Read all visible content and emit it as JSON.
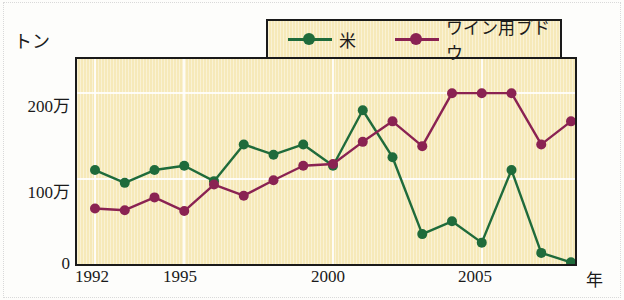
{
  "chart_data": {
    "type": "line",
    "title": "",
    "xlabel": "年",
    "ylabel": "トン",
    "grid": true,
    "legend_position": "top-center",
    "x": [
      1992,
      1993,
      1994,
      1995,
      1996,
      1997,
      1998,
      1999,
      2000,
      2001,
      2002,
      2003,
      2004,
      2005,
      2006,
      2007,
      2008
    ],
    "xlim": [
      1992,
      2008
    ],
    "ylim": [
      0,
      240
    ],
    "y_unit": "万トン",
    "y_ticks": [
      0,
      100,
      200
    ],
    "y_tick_labels": [
      "0",
      "100万",
      "200万"
    ],
    "x_tick_years": [
      1992,
      1995,
      2000,
      2005
    ],
    "x_tick_labels": [
      "1992",
      "1995",
      "2000",
      "2005"
    ],
    "series": [
      {
        "name": "米",
        "color": "#1f6b3b",
        "marker": "circle",
        "values": [
          110,
          95,
          110,
          115,
          97,
          140,
          128,
          140,
          115,
          180,
          125,
          35,
          50,
          25,
          110,
          13,
          2
        ]
      },
      {
        "name": "ワイン用ブドウ",
        "color": "#8a2252",
        "marker": "circle",
        "values": [
          65,
          63,
          78,
          62,
          93,
          80,
          98,
          115,
          117,
          143,
          167,
          138,
          200,
          200,
          200,
          140,
          167
        ]
      }
    ]
  },
  "axes": {
    "y_title": "トン",
    "x_title": "年",
    "y_tick_labels": [
      "200万",
      "100万",
      "0"
    ],
    "x_tick_labels": [
      "1992",
      "1995",
      "2000",
      "2005"
    ]
  },
  "legend": {
    "entries": [
      {
        "label": "米",
        "color": "#1f6b3b"
      },
      {
        "label": "ワイン用ブドウ",
        "color": "#8a2252"
      }
    ]
  },
  "colors": {
    "plot_background": "#f6e9b9",
    "frame": "#1a1a1a",
    "gridline": "#ffffff",
    "series_rice": "#1f6b3b",
    "series_grape": "#8a2252"
  }
}
